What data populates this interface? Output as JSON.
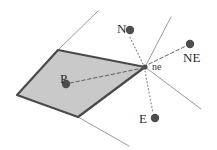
{
  "figure": {
    "type": "diagram",
    "subtype": "voronoi-neighbor-cell-diagram",
    "width": 217,
    "height": 150,
    "background_color": "#ffffff"
  },
  "colors": {
    "cell_fill": "#c9c9c9",
    "cell_stroke": "#4a4a4a",
    "thin_line": "#8f8f8f",
    "dot_fill": "#4d4d4d",
    "dashed_line": "#555555",
    "dotted_line": "#909090",
    "label_text": "#2b2b2b"
  },
  "labels": [
    {
      "id": "P",
      "text": "P",
      "x": 60,
      "y": 72,
      "size": "cap"
    },
    {
      "id": "ne",
      "text": "ne",
      "x": 152,
      "y": 62,
      "size": "small"
    },
    {
      "id": "N",
      "text": "N",
      "x": 117,
      "y": 22,
      "size": "cap"
    },
    {
      "id": "NE",
      "text": "NE",
      "x": 183,
      "y": 51,
      "size": "cap"
    },
    {
      "id": "E",
      "text": "E",
      "x": 139,
      "y": 112,
      "size": "cap"
    }
  ],
  "points": [
    {
      "id": "P-dot",
      "label": "P",
      "x": 66,
      "y": 84,
      "r": 4.2
    },
    {
      "id": "N-dot",
      "label": "N",
      "x": 130,
      "y": 30,
      "r": 4.2
    },
    {
      "id": "NE-dot",
      "label": "NE",
      "x": 190,
      "y": 44,
      "r": 4.2
    },
    {
      "id": "E-dot",
      "label": "E",
      "x": 155,
      "y": 118,
      "r": 4.2
    },
    {
      "id": "ne-vertex",
      "label": "ne",
      "x": 145,
      "y": 67,
      "r": 2.6
    }
  ],
  "cell_polygon": {
    "id": "cell-P",
    "points": "58,50 145,67 78,117 17,95",
    "fill": "#c9c9c9",
    "stroke": "#4a4a4a",
    "stroke_width": 2.2
  },
  "thin_lines": [
    {
      "id": "edge-upper-left",
      "x1": 58,
      "y1": 50,
      "x2": 98,
      "y2": 11
    },
    {
      "id": "edge-upper-right",
      "x1": 145,
      "y1": 67,
      "x2": 171,
      "y2": 17
    },
    {
      "id": "edge-lower-right",
      "x1": 145,
      "y1": 67,
      "x2": 201,
      "y2": 109
    },
    {
      "id": "edge-lower-left",
      "x1": 78,
      "y1": 117,
      "x2": 129,
      "y2": 146
    }
  ],
  "dashed_lines": [
    {
      "id": "link-P-to-ne",
      "x1": 70,
      "y1": 83,
      "x2": 143,
      "y2": 68
    },
    {
      "id": "link-ne-to-NE",
      "x1": 149,
      "y1": 64,
      "x2": 186,
      "y2": 46
    }
  ],
  "dotted_lines": [
    {
      "id": "link-ne-to-N",
      "x1": 143,
      "y1": 64,
      "x2": 129,
      "y2": 35
    },
    {
      "id": "link-ne-to-E",
      "x1": 145,
      "y1": 71,
      "x2": 153,
      "y2": 113
    }
  ]
}
